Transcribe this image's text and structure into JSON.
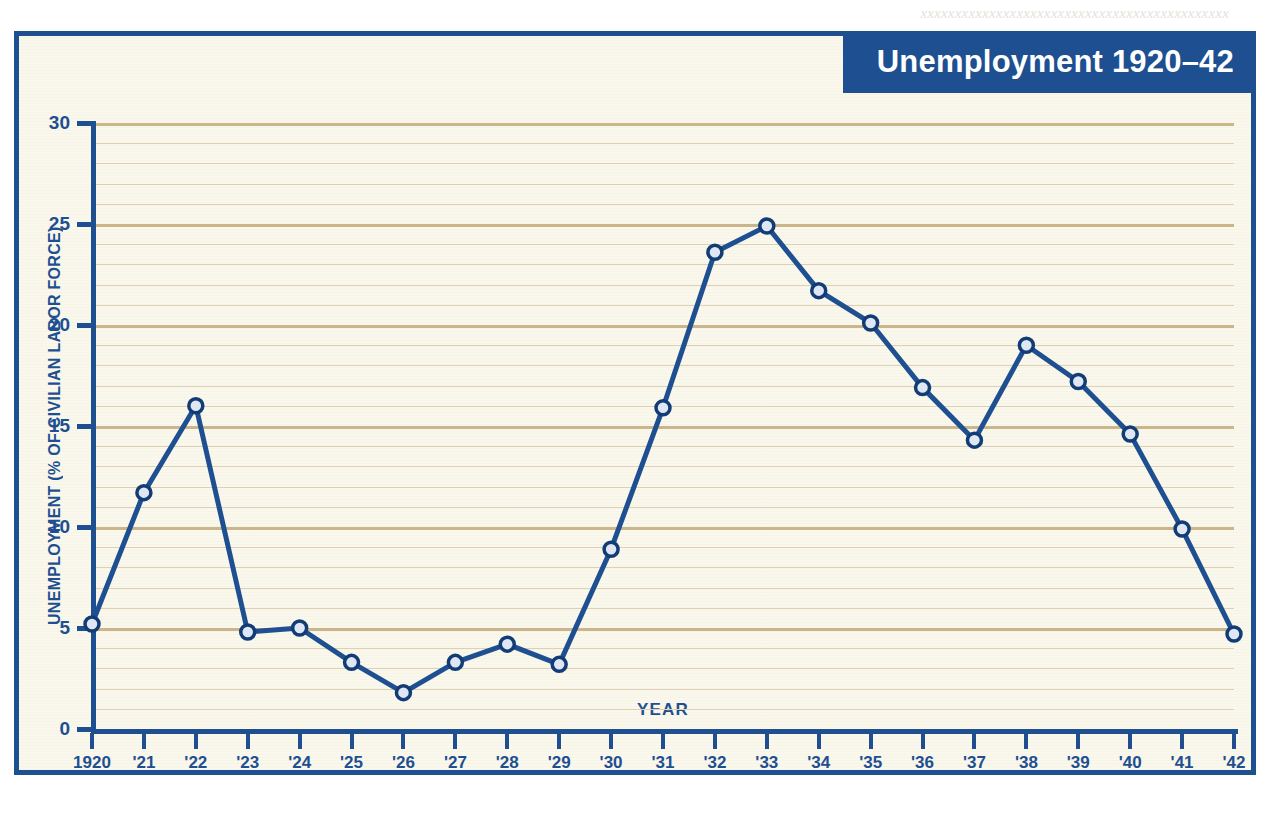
{
  "bleed_text": "xxxxxxxxxxxxxxxxxxxxxxxxxxxxxxxxxxxxxxxxxxxxx",
  "banner": {
    "title": "Unemployment 1920–42"
  },
  "colors": {
    "frame": "#1d4f91",
    "banner_bg": "#1d4f91",
    "banner_text": "#ffffff",
    "plot_bg": "#faf7ec",
    "gridline_minor": "#ded0b2",
    "gridline_major": "#cbb68c",
    "line": "#1d4f91",
    "marker_fill": "#dfe7f4",
    "marker_stroke": "#123c75",
    "axis_text": "#1d4f91"
  },
  "chart_data": {
    "type": "line",
    "title": "Unemployment 1920–42",
    "xlabel": "YEAR",
    "ylabel": "UNEMPLOYMENT (% OF CIVILIAN LABOR FORCE)",
    "ylim": [
      0,
      30
    ],
    "yticks": [
      0,
      5,
      10,
      15,
      20,
      25,
      30
    ],
    "ytick_labels": [
      "0",
      "5",
      "10",
      "15",
      "20",
      "25",
      "30"
    ],
    "grid": "horizontal major every 5, minor every 1",
    "legend": "none",
    "x": [
      1920,
      1921,
      1922,
      1923,
      1924,
      1925,
      1926,
      1927,
      1928,
      1929,
      1930,
      1931,
      1932,
      1933,
      1934,
      1935,
      1936,
      1937,
      1938,
      1939,
      1940,
      1941,
      1942
    ],
    "categories": [
      "1920",
      "'21",
      "'22",
      "'23",
      "'24",
      "'25",
      "'26",
      "'27",
      "'28",
      "'29",
      "'30",
      "'31",
      "'32",
      "'33",
      "'34",
      "'35",
      "'36",
      "'37",
      "'38",
      "'39",
      "'40",
      "'41",
      "'42"
    ],
    "values": [
      5.2,
      11.7,
      16.0,
      4.8,
      5.0,
      3.3,
      1.8,
      3.3,
      4.2,
      3.2,
      8.9,
      15.9,
      23.6,
      24.9,
      21.7,
      20.1,
      16.9,
      14.3,
      19.0,
      17.2,
      14.6,
      9.9,
      4.7
    ],
    "series": [
      {
        "name": "Unemployment (% of civilian labor force)",
        "values": [
          5.2,
          11.7,
          16.0,
          4.8,
          5.0,
          3.3,
          1.8,
          3.3,
          4.2,
          3.2,
          8.9,
          15.9,
          23.6,
          24.9,
          21.7,
          20.1,
          16.9,
          14.3,
          19.0,
          17.2,
          14.6,
          9.9,
          4.7
        ]
      }
    ]
  }
}
